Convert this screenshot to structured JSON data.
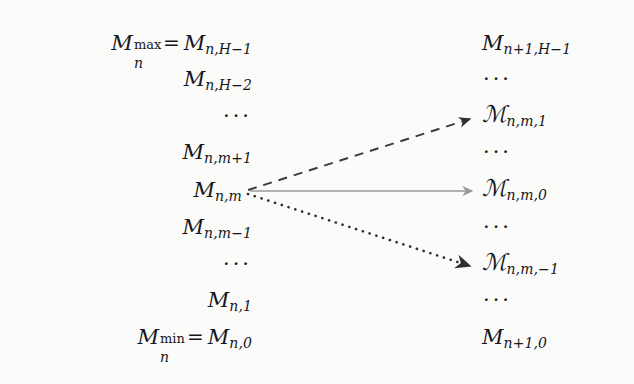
{
  "figure": {
    "background_color": "#fbfbfa",
    "text_color": "#16161a"
  },
  "left_column": {
    "name": "source-macrostate-ladder",
    "align": "right",
    "rows": [
      {
        "id": "m-max",
        "kind": "equation",
        "label": "M_n^max = M_{n,H-1}",
        "nucleus": "M",
        "sup": "max",
        "sub_n": "n",
        "relation": "=",
        "rhs_nucleus": "M",
        "rhs_sub": "n,H−1",
        "y": 28
      },
      {
        "id": "m-h-2",
        "kind": "term",
        "label": "M_{n,H-2}",
        "nucleus": "M",
        "sub": "n,H−2",
        "y": 64
      },
      {
        "id": "gap-upper",
        "kind": "ellipsis",
        "label": "···",
        "y": 101
      },
      {
        "id": "m-m-plus-1",
        "kind": "term",
        "label": "M_{n,m+1}",
        "nucleus": "M",
        "sub": "n,m+1",
        "y": 137
      },
      {
        "id": "m-m",
        "kind": "term",
        "label": "M_{n,m}",
        "nucleus": "M",
        "sub": "n,m",
        "y": 175
      },
      {
        "id": "m-m-minus-1",
        "kind": "term",
        "label": "M_{n,m-1}",
        "nucleus": "M",
        "sub": "n,m−1",
        "y": 212
      },
      {
        "id": "gap-lower",
        "kind": "ellipsis",
        "label": "···",
        "y": 249
      },
      {
        "id": "m-1",
        "kind": "term",
        "label": "M_{n,1}",
        "nucleus": "M",
        "sub": "n,1",
        "y": 285
      },
      {
        "id": "m-min",
        "kind": "equation",
        "label": "M_n^min = M_{n,0}",
        "nucleus": "M",
        "sup": "min",
        "sub_n": "n",
        "relation": "=",
        "rhs_nucleus": "M",
        "rhs_sub": "n,0",
        "y": 322
      }
    ]
  },
  "right_column": {
    "name": "target-macrostate-ladder",
    "align": "left",
    "rows": [
      {
        "id": "t-h-1",
        "kind": "term",
        "script": false,
        "label": "M_{n+1,H-1}",
        "nucleus": "M",
        "sub": "n+1,H−1",
        "y": 28
      },
      {
        "id": "t-gap-1",
        "kind": "ellipsis",
        "label": "···",
        "y": 64
      },
      {
        "id": "t-cal-1",
        "kind": "term",
        "script": true,
        "label": "ℳ_{n,m,1}",
        "nucleus": "ℳ",
        "sub": "n,m,1",
        "y": 101
      },
      {
        "id": "t-gap-2",
        "kind": "ellipsis",
        "label": "···",
        "y": 137
      },
      {
        "id": "t-cal-0",
        "kind": "term",
        "script": true,
        "label": "ℳ_{n,m,0}",
        "nucleus": "ℳ",
        "sub": "n,m,0",
        "y": 175
      },
      {
        "id": "t-gap-3",
        "kind": "ellipsis",
        "label": "···",
        "y": 212
      },
      {
        "id": "t-cal-m1",
        "kind": "term",
        "script": true,
        "label": "ℳ_{n,m,-1}",
        "nucleus": "ℳ",
        "sub": "n,m,−1",
        "y": 249
      },
      {
        "id": "t-gap-4",
        "kind": "ellipsis",
        "label": "···",
        "y": 285
      },
      {
        "id": "t-0",
        "kind": "term",
        "script": false,
        "label": "M_{n+1,0}",
        "nucleus": "M",
        "sub": "n+1,0",
        "y": 322
      }
    ]
  },
  "arrows": [
    {
      "id": "arrow-up",
      "name": "transition-arrow-up",
      "style": "dashed",
      "color": "#3c3c3e",
      "width": 2.0,
      "dash_pattern": "9 7",
      "from": {
        "x": 248,
        "y": 190
      },
      "to": {
        "x": 470,
        "y": 119
      },
      "source_row": "m-m",
      "target_row": "t-cal-1"
    },
    {
      "id": "arrow-level",
      "name": "transition-arrow-level",
      "style": "solid",
      "color": "#9a9a9c",
      "width": 1.7,
      "dash_pattern": "",
      "from": {
        "x": 250,
        "y": 191
      },
      "to": {
        "x": 472,
        "y": 191
      },
      "source_row": "m-m",
      "target_row": "t-cal-0"
    },
    {
      "id": "arrow-down",
      "name": "transition-arrow-down",
      "style": "dotted",
      "color": "#2f2f32",
      "width": 2.6,
      "dash_pattern": "0.1 7",
      "from": {
        "x": 248,
        "y": 194
      },
      "to": {
        "x": 470,
        "y": 266
      },
      "source_row": "m-m",
      "target_row": "t-cal-m1"
    }
  ]
}
